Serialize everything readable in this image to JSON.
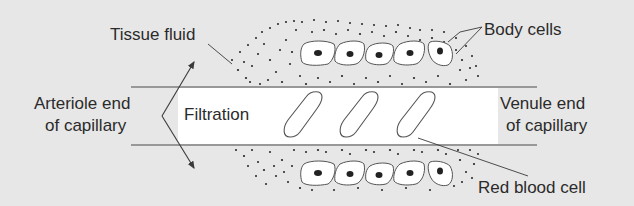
{
  "diagram": {
    "labels": {
      "tissue_fluid": "Tissue fluid",
      "body_cells": "Body cells",
      "arteriole_end_line1": "Arteriole end",
      "arteriole_end_line2": "of capillary",
      "filtration": "Filtration",
      "venule_end_line1": "Venule end",
      "venule_end_line2": "of capillary",
      "red_blood_cell": "Red blood cell"
    },
    "structures": {
      "capillary": "horizontal band between two walls",
      "red_blood_cells_count": 3,
      "body_cells_top_count": 5,
      "body_cells_bottom_count": 5
    },
    "colors": {
      "background": "#e7e7e7",
      "capillary_fill": "#ffffff",
      "line": "#4a4a4a",
      "dots": "#222222",
      "text": "#2b2b2b"
    }
  }
}
